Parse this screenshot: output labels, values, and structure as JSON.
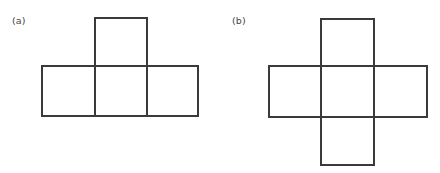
{
  "canvas": {
    "width": 440,
    "height": 173,
    "background_color": "#ffffff"
  },
  "style": {
    "stroke_color": "#3a3a3a",
    "stroke_width": 1.7,
    "label_color": "#444444",
    "label_font_size_px": 9.5
  },
  "figures": [
    {
      "id": "a",
      "label": "(a)",
      "shape_name": "t-shaped-cube-net",
      "square_count": 4,
      "square_size_px": 52,
      "origin_x": 0,
      "squares": [
        {
          "name": "row-left-square",
          "x": 42,
          "y": 66,
          "w": 53,
          "h": 50
        },
        {
          "name": "row-middle-square",
          "x": 95,
          "y": 66,
          "w": 52,
          "h": 50
        },
        {
          "name": "row-right-square",
          "x": 147,
          "y": 66,
          "w": 51,
          "h": 50
        },
        {
          "name": "top-square",
          "x": 95,
          "y": 18,
          "w": 52,
          "h": 48
        }
      ]
    },
    {
      "id": "b",
      "label": "(b)",
      "shape_name": "cross-shaped-cube-net",
      "square_count": 5,
      "square_size_px": 53,
      "origin_x": 220,
      "squares": [
        {
          "name": "row-left-square",
          "x": 49,
          "y": 66,
          "w": 52,
          "h": 51
        },
        {
          "name": "row-middle-square",
          "x": 101,
          "y": 66,
          "w": 53,
          "h": 51
        },
        {
          "name": "row-right-square",
          "x": 154,
          "y": 66,
          "w": 53,
          "h": 51
        },
        {
          "name": "top-square",
          "x": 101,
          "y": 19,
          "w": 53,
          "h": 47
        },
        {
          "name": "bottom-square",
          "x": 101,
          "y": 117,
          "w": 53,
          "h": 48
        }
      ]
    }
  ]
}
